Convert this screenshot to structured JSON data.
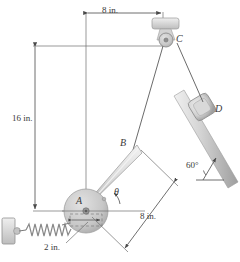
{
  "figure": {
    "colors": {
      "line": "#4a4a4a",
      "thin": "#777777",
      "bar_light": "#e8e8e8",
      "bar_mid": "#c9c9c9",
      "bar_dark": "#a8a8a8",
      "disk": "#cccccc",
      "cable": "#6b6b6b",
      "spring": "#8a8a8a",
      "text": "#3a3a3a"
    }
  },
  "dimensions": [
    {
      "id": "top",
      "label": "8 in.",
      "x": 102,
      "y": 9
    },
    {
      "id": "left",
      "label": "16 in.",
      "x": 14,
      "y": 118
    },
    {
      "id": "crank",
      "label": "8 in.",
      "x": 143,
      "y": 217
    },
    {
      "id": "disk",
      "label": "2 in.",
      "x": 52,
      "y": 246
    }
  ],
  "points": [
    {
      "id": "A",
      "label": "A",
      "x": 73,
      "y": 199
    },
    {
      "id": "B",
      "label": "B",
      "x": 123,
      "y": 143
    },
    {
      "id": "C",
      "label": "C",
      "x": 180,
      "y": 38
    },
    {
      "id": "D",
      "label": "D",
      "x": 214,
      "y": 108
    }
  ],
  "angles": [
    {
      "id": "theta",
      "label": "θ",
      "x": 116,
      "y": 191
    },
    {
      "id": "incline",
      "label": "60°",
      "x": 192,
      "y": 166
    }
  ],
  "components": {
    "pulley_c": "pulley-at-c",
    "collar_d": "collar-block-d",
    "disk_a": "crank-disk-a",
    "link_ab": "crank-link-ab",
    "cable_bc": "cable-b-to-c",
    "cable_cd": "cable-c-to-d",
    "rod": "inclined-guide-rod",
    "spring": "spring",
    "wall": "wall-support"
  }
}
